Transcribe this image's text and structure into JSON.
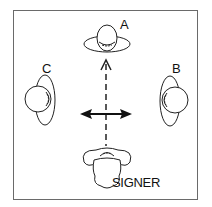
{
  "diagram": {
    "labels": {
      "a": "A",
      "b": "B",
      "c": "C",
      "signer": "SIGNER"
    },
    "arrows": {
      "vertical": "dashed arrow from signer toward A",
      "horizontal": "solid double-headed arrow between C and B"
    },
    "colors": {
      "stroke": "#222222",
      "frame": "#6a6a6a",
      "background": "#ffffff"
    }
  }
}
